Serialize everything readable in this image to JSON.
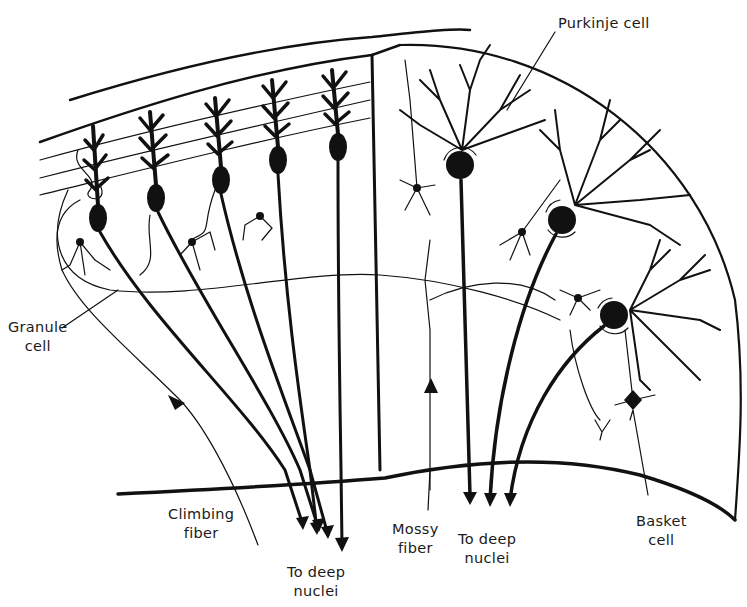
{
  "diagram": {
    "type": "neuroanatomy-schematic",
    "colors": {
      "ink": "#111111",
      "background": "#ffffff"
    },
    "labels": {
      "purkinje_cell": "Purkinje cell",
      "granule_cell_line1": "Granule",
      "granule_cell_line2": "cell",
      "climbing_fiber_line1": "Climbing",
      "climbing_fiber_line2": "fiber",
      "to_deep_nuclei_left_line1": "To deep",
      "to_deep_nuclei_left_line2": "nuclei",
      "mossy_fiber_line1": "Mossy",
      "mossy_fiber_line2": "fiber",
      "to_deep_nuclei_right_line1": "To deep",
      "to_deep_nuclei_right_line2": "nuclei",
      "basket_cell_line1": "Basket",
      "basket_cell_line2": "cell"
    },
    "panels": [
      {
        "name": "left-panel",
        "view": "side view of Purkinje cells with climbing fiber input",
        "purkinje_cells": 5
      },
      {
        "name": "right-panel",
        "view": "face view of Purkinje cells with mossy fiber input",
        "purkinje_cells": 3
      }
    ]
  }
}
